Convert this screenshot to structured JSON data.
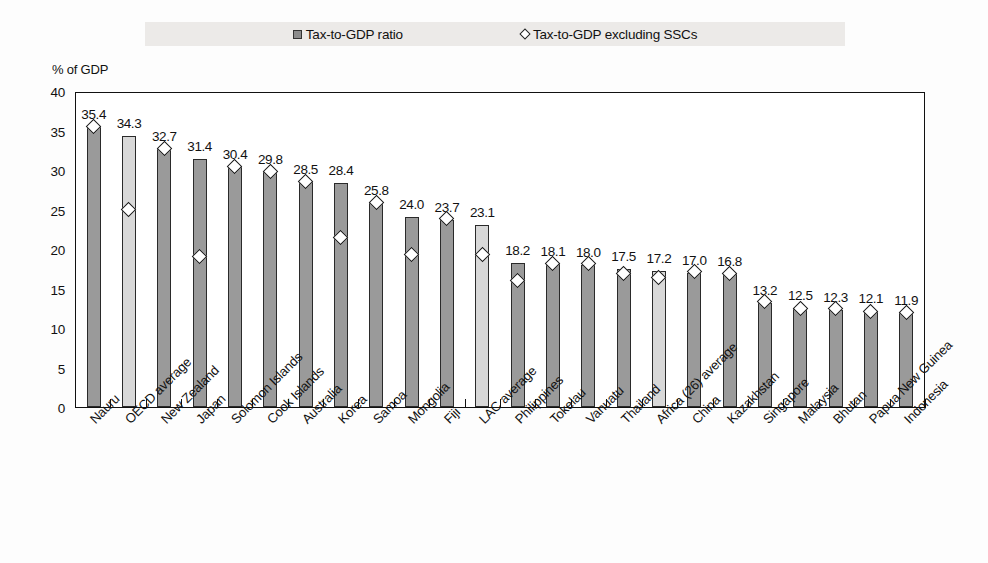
{
  "legend": {
    "series1_label": "Tax-to-GDP ratio",
    "series1_icon": "filled-square-icon",
    "series2_label": "Tax-to-GDP excluding SSCs",
    "series2_icon": "diamond-outline-icon"
  },
  "axis": {
    "y_title": "% of GDP",
    "y_ticks": [
      "40",
      "35",
      "30",
      "25",
      "20",
      "15",
      "10",
      "5",
      "0"
    ]
  },
  "colors": {
    "bar_country": "#9a9a9a",
    "bar_average": "#d8d8d8",
    "marker_fill": "#ffffff",
    "outline": "#222222",
    "legend_band": "#eceae8"
  },
  "chart_data": {
    "type": "bar",
    "title": "",
    "xlabel": "",
    "ylabel": "% of GDP",
    "ylim": [
      0,
      40
    ],
    "ytick_step": 5,
    "grid": false,
    "legend_position": "top-center",
    "categories": [
      "Nauru",
      "OECD average",
      "New Zealand",
      "Japan",
      "Solomon Islands",
      "Cook Islands",
      "Australia",
      "Korea",
      "Samoa",
      "Mongolia",
      "Fiji",
      "LAC average",
      "Philippines",
      "Tokelau",
      "Vanuatu",
      "Thailand",
      "Africa (26) average",
      "China",
      "Kazakhstan",
      "Singapore",
      "Malaysia",
      "Bhutan",
      "Papua New Guinea",
      "Indonesia"
    ],
    "category_is_average": [
      false,
      true,
      false,
      false,
      false,
      false,
      false,
      false,
      false,
      false,
      false,
      true,
      false,
      false,
      false,
      false,
      true,
      false,
      false,
      false,
      false,
      false,
      false,
      false
    ],
    "series": [
      {
        "name": "Tax-to-GDP ratio",
        "type": "bar",
        "values": [
          35.4,
          34.3,
          32.7,
          31.4,
          30.4,
          29.8,
          28.5,
          28.4,
          25.8,
          24.0,
          23.7,
          23.1,
          18.2,
          18.1,
          18.0,
          17.5,
          17.2,
          17.0,
          16.8,
          13.2,
          12.5,
          12.3,
          12.1,
          11.9
        ],
        "data_labels": [
          "35.4",
          "34.3",
          "32.7",
          "31.4",
          "30.4",
          "29.8",
          "28.5",
          "28.4",
          "25.8",
          "24.0",
          "23.7",
          "23.1",
          "18.2",
          "18.1",
          "18.0",
          "17.5",
          "17.2",
          "17.0",
          "16.8",
          "13.2",
          "12.5",
          "12.3",
          "12.1",
          "11.9"
        ]
      },
      {
        "name": "Tax-to-GDP excluding SSCs",
        "type": "scatter",
        "marker": "diamond",
        "values": [
          35.4,
          24.9,
          32.6,
          18.9,
          30.3,
          29.7,
          28.4,
          21.3,
          25.8,
          19.2,
          23.7,
          19.2,
          15.9,
          18.1,
          18.0,
          16.8,
          16.3,
          17.0,
          16.8,
          13.2,
          12.4,
          12.3,
          12.0,
          11.8
        ]
      }
    ]
  }
}
